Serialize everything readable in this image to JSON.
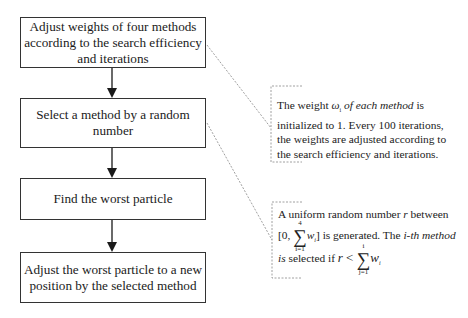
{
  "flowchart": {
    "steps": [
      {
        "id": "step-1",
        "lines": [
          "Adjust weights of four methods",
          "according to the search efficiency",
          "and iterations"
        ]
      },
      {
        "id": "step-2",
        "lines": [
          "Select a method  by a random",
          "number"
        ]
      },
      {
        "id": "step-3",
        "lines": [
          "Find the worst particle"
        ]
      },
      {
        "id": "step-4",
        "lines": [
          "Adjust the worst particle to a new",
          "position by the selected method"
        ]
      }
    ]
  },
  "notes": {
    "weights_note": {
      "line1_a": "The weight ",
      "symbol": "ω",
      "symbol_sub": "i",
      "line1_b": " of  each method",
      "line1_c": " is",
      "line2": "initialized to 1.  Every 100 iterations,",
      "line3": "the weights are adjusted according to",
      "line4": "the search efficiency and iterations."
    },
    "selection_note": {
      "line1_a": "A uniform random number ",
      "var_r": "r",
      "line1_b": "  between",
      "bracket_open": "[0, ",
      "sum1_sup": "4",
      "sum1_sub": "i=1",
      "sum1_term": "w",
      "sum1_term_sub": "i",
      "bracket_close": "]",
      "line2_a": " is generated. The ",
      "line2_b": "i-th method",
      "line3_a": "is",
      "line3_b": " selected if  ",
      "ineq": "r < ",
      "sum2_sup": "i",
      "sum2_sub": "j=1",
      "sum2_term": "w",
      "sum2_term_sub": "i"
    }
  },
  "colors": {
    "box_border": "#333333",
    "connector": "#777777",
    "arrow": "#1a1a1a"
  }
}
